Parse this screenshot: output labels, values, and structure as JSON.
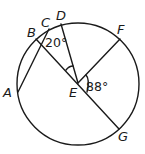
{
  "diagram": {
    "type": "circle-geometry",
    "circle": {
      "cx": 78,
      "cy": 84,
      "r": 61
    },
    "points": {
      "A": {
        "label": "A",
        "x": 18,
        "y": 92
      },
      "B": {
        "label": "B",
        "x": 36,
        "y": 39
      },
      "C": {
        "label": "C",
        "x": 49,
        "y": 29
      },
      "D": {
        "label": "D",
        "x": 61,
        "y": 24
      },
      "E": {
        "label": "E",
        "x": 78,
        "y": 83
      },
      "F": {
        "label": "F",
        "x": 120,
        "y": 39
      },
      "G": {
        "label": "G",
        "x": 119,
        "y": 129
      }
    },
    "segments": [
      "BG",
      "AC",
      "ED",
      "EF"
    ],
    "angles": {
      "angle_at_B": {
        "value": "20°",
        "between": "CB, BE"
      },
      "angle_BED_mark": {
        "value": "",
        "between": "EB, ED"
      },
      "angle_FEG": {
        "value": "88°",
        "between": "EF, EG"
      }
    },
    "label_text": {
      "A": "A",
      "B": "B",
      "C": "C",
      "D": "D",
      "E": "E",
      "F": "F",
      "G": "G",
      "angle1": "20°",
      "angle2": "88°"
    }
  }
}
